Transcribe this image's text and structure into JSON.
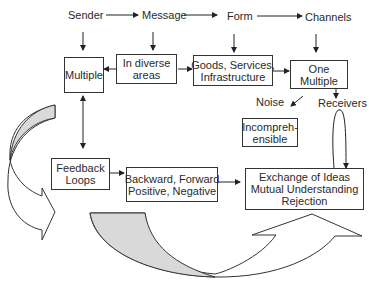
{
  "diagram": {
    "top_labels": {
      "sender": "Sender",
      "message": "Message",
      "form": "Form",
      "channels": "Channels"
    },
    "boxes": {
      "multiple": [
        "Multiple"
      ],
      "diverse_areas": [
        "In diverse",
        "areas"
      ],
      "goods_services": [
        "Goods, Services,",
        "Infrastructure"
      ],
      "one_multiple": [
        "One",
        "Multiple"
      ],
      "incomprehensible": [
        "Incompreh-",
        "ensible"
      ],
      "feedback_loops": [
        "Feedback",
        "Loops"
      ],
      "backward_forward": [
        "Backward, Forward",
        "Positive, Negative"
      ],
      "exchange": [
        "Exchange of Ideas",
        "Mutual Understanding",
        "Rejection"
      ]
    },
    "floating_labels": {
      "noise": "Noise",
      "receivers": "Receivers"
    },
    "colors": {
      "stroke": "#333333",
      "curved_arrow_fill": "#d9d9d9",
      "background": "#ffffff"
    }
  }
}
